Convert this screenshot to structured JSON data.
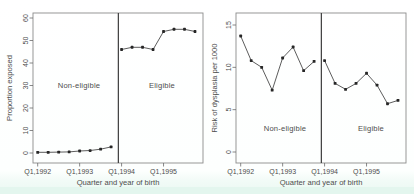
{
  "colors": {
    "line": "#4a4a4a",
    "marker": "#262626",
    "box": "#8c8c8c",
    "divider": "#3c3c3c",
    "tick": "#6a6a6a",
    "text": "#4d4d4d",
    "scan_strip": "#e3f6ee"
  },
  "chart_data": [
    {
      "type": "line",
      "title": "",
      "xlabel": "Quarter and year of birth",
      "ylabel": "Proportion exposed",
      "categories": [
        "Q1,1992",
        "Q2,1992",
        "Q3,1992",
        "Q4,1992",
        "Q1,1993",
        "Q2,1993",
        "Q3,1993",
        "Q4,1993",
        "Q1,1994",
        "Q2,1994",
        "Q3,1994",
        "Q4,1994",
        "Q1,1995",
        "Q2,1995",
        "Q3,1995",
        "Q4,1995"
      ],
      "values": [
        0.3,
        0.3,
        0.4,
        0.5,
        0.9,
        1.1,
        1.7,
        2.7,
        46,
        47,
        47,
        46,
        54,
        55,
        55,
        54
      ],
      "ylim": [
        0,
        60
      ],
      "yticks": [
        0,
        10,
        20,
        30,
        40,
        50,
        60
      ],
      "xticklabels": [
        "Q1,1992",
        "Q1,1993",
        "Q1,1994",
        "Q1,1995"
      ],
      "xtick_indices": [
        0,
        4,
        8,
        12
      ],
      "divider_after_index": 7,
      "grid": false,
      "legend": "none",
      "annotations": [
        {
          "text": "Non-eligible",
          "section": "left-of-divider"
        },
        {
          "text": "Eligible",
          "section": "right-of-divider"
        }
      ]
    },
    {
      "type": "line",
      "title": "",
      "xlabel": "Quarter and year of birth",
      "ylabel": "Risk of dysplasia per 1000",
      "categories": [
        "Q1,1992",
        "Q2,1992",
        "Q3,1992",
        "Q4,1992",
        "Q1,1993",
        "Q2,1993",
        "Q3,1993",
        "Q4,1993",
        "Q1,1994",
        "Q2,1994",
        "Q3,1994",
        "Q4,1994",
        "Q1,1995",
        "Q2,1995",
        "Q3,1995",
        "Q4,1995"
      ],
      "values": [
        13.7,
        10.8,
        10.0,
        7.3,
        11.1,
        12.4,
        9.6,
        10.7,
        10.8,
        8.1,
        7.4,
        8.1,
        9.3,
        7.9,
        5.7,
        6.1
      ],
      "ylim": [
        0,
        15
      ],
      "yticks": [
        0,
        5,
        10,
        15
      ],
      "xticklabels": [
        "Q1,1992",
        "Q1,1993",
        "Q1,1994",
        "Q1,1995"
      ],
      "xtick_indices": [
        0,
        4,
        8,
        12
      ],
      "divider_after_index": 7,
      "grid": false,
      "legend": "none",
      "annotations": [
        {
          "text": "Non-eligible",
          "section": "left-of-divider"
        },
        {
          "text": "Eligible",
          "section": "right-of-divider"
        }
      ]
    }
  ]
}
